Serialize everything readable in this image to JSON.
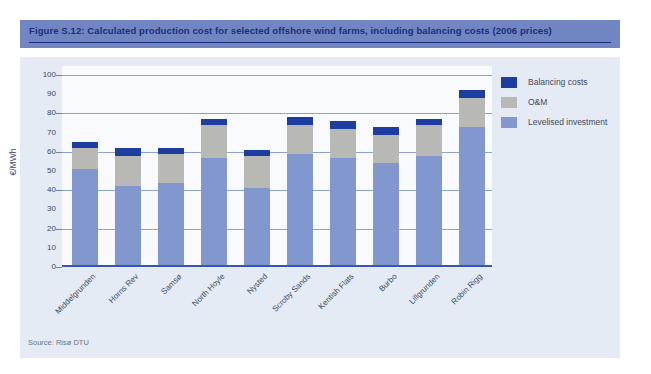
{
  "figure": {
    "title": "Figure S.12: Calculated production cost for selected offshore wind farms, including balancing costs (2006 prices)",
    "source": "Source: Risø DTU"
  },
  "chart_data": {
    "type": "bar",
    "stacked": true,
    "title": "Figure S.12: Calculated production cost for selected offshore wind farms, including balancing costs (2006 prices)",
    "categories": [
      "Middelgrunden",
      "Horns Rev",
      "Samsø",
      "North Hoyle",
      "Nysted",
      "Scroby Sands",
      "Kentish Flats",
      "Burbo",
      "Lillgrunden",
      "Robin Rigg"
    ],
    "series": [
      {
        "name": "Balancing costs",
        "color": "#1e3da1",
        "values": [
          3,
          4,
          3,
          3,
          3,
          4,
          4,
          4,
          3,
          4
        ]
      },
      {
        "name": "O&M",
        "color": "#b8b9b5",
        "values": [
          11,
          16,
          15,
          17,
          17,
          15,
          15,
          15,
          16,
          15
        ]
      },
      {
        "name": "Levelised investment",
        "color": "#8297ce",
        "values": [
          51,
          42,
          44,
          57,
          41,
          59,
          57,
          54,
          58,
          73
        ]
      }
    ],
    "totals": [
      65,
      62,
      62,
      77,
      61,
      78,
      76,
      73,
      77,
      92
    ],
    "xlabel": "",
    "ylabel": "€/MWh",
    "ylim": [
      0,
      100
    ],
    "ytick_step": 10,
    "gridline_step": 20,
    "grid": true,
    "legend_position": "top-right",
    "legend_entries": [
      "Balancing costs",
      "O&M",
      "Levelised investment"
    ]
  },
  "colors": {
    "title_bar_bg": "#7185c3",
    "title_text": "#1a2f7c",
    "panel_bg": "#e4ebf5",
    "plot_bg": "#f8fafd",
    "gridline": "#8da2cd",
    "baseline": "#3a56ac",
    "balancing": "#1e3da1",
    "oam": "#b8b9b5",
    "levelised": "#8297ce"
  }
}
